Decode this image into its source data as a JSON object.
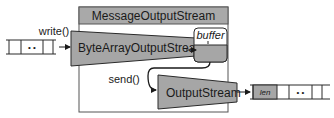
{
  "diagram": {
    "container": {
      "title": "MessageOutputStream"
    },
    "input_array": {
      "cells": [
        "",
        "• •",
        ""
      ]
    },
    "write_label": "write()",
    "byte_array_stream": {
      "label": "ByteArrayOutputStream"
    },
    "buffer": {
      "label": "buffer"
    },
    "send_label": "send()",
    "output_stream": {
      "label": "OutputStream"
    },
    "output_array": {
      "cells": [
        "len",
        "",
        "• •",
        ""
      ]
    },
    "colors": {
      "gray_fill": "#a6a6a6",
      "title_fill": "#a9a9a9",
      "stroke": "#2a2a2a",
      "container_stroke": "#555555",
      "background": "#ffffff"
    }
  }
}
